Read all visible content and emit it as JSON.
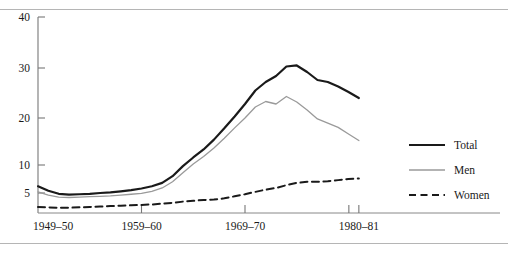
{
  "figure": {
    "background_color": "#ffffff",
    "rule_color": "#b5b5b5",
    "has_top_rule": true,
    "has_bottom_rule": true
  },
  "chart_data": {
    "type": "line",
    "title": "",
    "subtitle": "",
    "xlabel": "",
    "ylabel": "",
    "grid": false,
    "legend_position": "right",
    "y_scale": "nonlinear-compressed",
    "yticks": [
      5,
      10,
      20,
      30,
      40
    ],
    "ytick_labels": [
      "5",
      "10",
      "20",
      "30",
      "40"
    ],
    "ylim": [
      0,
      40
    ],
    "xticks": [
      "1949-50",
      "1959-60",
      "1969-70",
      "1980-81"
    ],
    "xtick_labels": [
      "1949–50",
      "1959–60",
      "1969–70",
      "1980–81"
    ],
    "xlim": [
      "1949-50",
      "1981-82"
    ],
    "x": [
      "1949-50",
      "1950-51",
      "1951-52",
      "1952-53",
      "1953-54",
      "1954-55",
      "1955-56",
      "1956-57",
      "1957-58",
      "1958-59",
      "1959-60",
      "1960-61",
      "1961-62",
      "1962-63",
      "1963-64",
      "1964-65",
      "1965-66",
      "1966-67",
      "1967-68",
      "1968-69",
      "1969-70",
      "1970-71",
      "1971-72",
      "1972-73",
      "1973-74",
      "1974-75",
      "1975-76",
      "1976-77",
      "1977-78",
      "1978-79",
      "1979-80",
      "1980-81"
    ],
    "series": [
      {
        "name": "Total",
        "color": "#1a1a1a",
        "line_style": "solid",
        "line_width": 2.2,
        "values": [
          6.2,
          5.4,
          4.8,
          4.6,
          4.7,
          4.8,
          5.0,
          5.1,
          5.3,
          5.5,
          5.8,
          6.2,
          6.8,
          8.0,
          9.8,
          11.6,
          13.3,
          15.4,
          17.8,
          20.3,
          22.8,
          25.5,
          27.2,
          28.4,
          30.3,
          30.5,
          29.2,
          27.6,
          27.2,
          26.3,
          25.2,
          24.0
        ]
      },
      {
        "name": "Men",
        "color": "#9a9a9a",
        "line_style": "solid",
        "line_width": 1.3,
        "values": [
          5.2,
          4.5,
          4.0,
          3.9,
          4.0,
          4.1,
          4.2,
          4.3,
          4.5,
          4.7,
          4.9,
          5.3,
          5.9,
          7.0,
          8.6,
          10.2,
          11.8,
          13.6,
          15.7,
          17.9,
          20.0,
          22.2,
          23.3,
          22.8,
          24.3,
          23.2,
          21.6,
          19.8,
          18.9,
          18.0,
          16.6,
          15.2
        ]
      },
      {
        "name": "Women",
        "color": "#1a1a1a",
        "line_style": "dashed",
        "line_width": 2.0,
        "values": [
          1.6,
          1.5,
          1.4,
          1.4,
          1.5,
          1.6,
          1.7,
          1.8,
          1.9,
          2.0,
          2.1,
          2.2,
          2.4,
          2.6,
          2.9,
          3.1,
          3.3,
          3.4,
          3.7,
          4.2,
          4.7,
          5.2,
          5.6,
          5.9,
          6.4,
          6.8,
          7.0,
          7.0,
          7.1,
          7.3,
          7.5,
          7.6
        ]
      }
    ],
    "legend": [
      {
        "label": "Total",
        "color": "#1a1a1a",
        "line_style": "solid",
        "line_width": 2.2
      },
      {
        "label": "Men",
        "color": "#9a9a9a",
        "line_style": "solid",
        "line_width": 1.3
      },
      {
        "label": "Women",
        "color": "#1a1a1a",
        "line_style": "dashed",
        "line_width": 2.0
      }
    ]
  }
}
